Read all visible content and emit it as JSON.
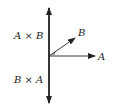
{
  "diagram": {
    "title": "",
    "labels": {
      "a_cross_b": "A × B",
      "b_cross_a": "B × A",
      "vector_a": "A",
      "vector_b": "B"
    },
    "colors": {
      "stroke": "#222222",
      "background": "#ffffff"
    }
  }
}
